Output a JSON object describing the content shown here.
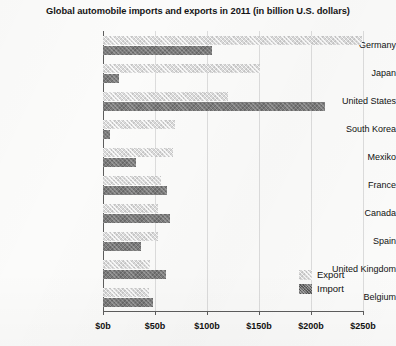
{
  "chart_data": {
    "type": "bar",
    "title": "Global automobile imports and exports in 2011 (in billion U.S. dollars)",
    "orientation": "horizontal",
    "xlabel": "",
    "ylabel": "",
    "xlim": [
      0,
      260
    ],
    "xticks": [
      0,
      50,
      100,
      150,
      200,
      250
    ],
    "xtick_labels": [
      "$0b",
      "$50b",
      "$100b",
      "$150b",
      "$200b",
      "$250b"
    ],
    "grid": true,
    "legend_position": "bottom-right",
    "categories": [
      "Germany",
      "Japan",
      "United States",
      "South Korea",
      "Mexiko",
      "France",
      "Canada",
      "Spain",
      "United Kingdom",
      "Belgium"
    ],
    "series": [
      {
        "name": "Export",
        "color": "#dadada",
        "values": [
          249,
          151,
          120,
          69,
          67,
          56,
          53,
          53,
          45,
          44
        ]
      },
      {
        "name": "Import",
        "color": "#7b7b7b",
        "values": [
          105,
          15,
          213,
          7,
          32,
          62,
          64,
          37,
          61,
          48
        ]
      }
    ]
  },
  "legend": {
    "items": [
      {
        "label": "Export",
        "key": "export"
      },
      {
        "label": "Import",
        "key": "import"
      }
    ]
  }
}
